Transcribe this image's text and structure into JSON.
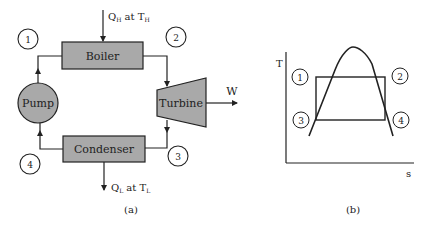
{
  "figure_a": {
    "caption": "(a)",
    "heat_in": {
      "q": "Q",
      "q_sub": "H",
      "mid": " at T",
      "t_sub": "H"
    },
    "heat_out": {
      "q": "Q",
      "q_sub": "L",
      "mid": " at T",
      "t_sub": "L"
    },
    "work_label": "W",
    "components": {
      "boiler": "Boiler",
      "turbine": "Turbine",
      "condenser": "Condenser",
      "pump": "Pump"
    },
    "states": [
      "1",
      "2",
      "3",
      "4"
    ]
  },
  "figure_b": {
    "caption": "(b)",
    "y_axis_label": "T",
    "x_axis_label": "s",
    "states": [
      "1",
      "2",
      "3",
      "4"
    ]
  },
  "colors": {
    "component_fill": "#a9a9a9",
    "stroke": "#222222",
    "background": "#ffffff"
  }
}
